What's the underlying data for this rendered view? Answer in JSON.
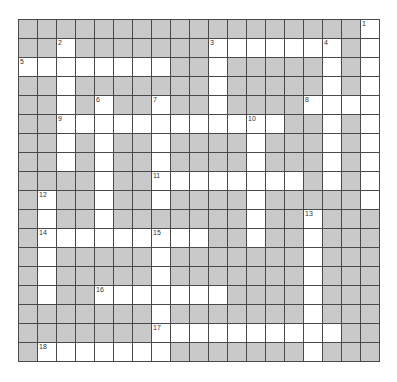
{
  "puzzle": {
    "rows": 18,
    "cols": 19,
    "colors": {
      "block": "#c9c9c9",
      "open": "#ffffff",
      "line": "#4a4a4a"
    },
    "layout": [
      "##################.",
      "##.#######.......#.",
      "........##.#####.#.",
      "##.#######.#####.#.",
      "##.#.##.##.####....",
      "##............##.#.",
      "##.#.##.####.###.#.",
      "##.#.##.####.###.#.",
      "####.##........#.#.",
      "#.##.##.####.#####.",
      "#.##.#######.##.###",
      "#.........##.##.###",
      "#.#####.#######.###",
      "#.#####.#######.###",
      "#.##.......####.###",
      "#######.#######.###",
      "#######..........##",
      "#.......#######.###"
    ],
    "numbers": [
      {
        "n": "1",
        "r": 0,
        "c": 18
      },
      {
        "n": "2",
        "r": 1,
        "c": 2
      },
      {
        "n": "3",
        "r": 1,
        "c": 10
      },
      {
        "n": "4",
        "r": 1,
        "c": 16
      },
      {
        "n": "5",
        "r": 2,
        "c": 0
      },
      {
        "n": "6",
        "r": 4,
        "c": 4
      },
      {
        "n": "7",
        "r": 4,
        "c": 7
      },
      {
        "n": "8",
        "r": 4,
        "c": 15
      },
      {
        "n": "9",
        "r": 5,
        "c": 2
      },
      {
        "n": "10",
        "r": 5,
        "c": 12
      },
      {
        "n": "11",
        "r": 8,
        "c": 7
      },
      {
        "n": "12",
        "r": 9,
        "c": 1
      },
      {
        "n": "13",
        "r": 10,
        "c": 15
      },
      {
        "n": "14",
        "r": 11,
        "c": 1
      },
      {
        "n": "15",
        "r": 11,
        "c": 7
      },
      {
        "n": "16",
        "r": 14,
        "c": 4
      },
      {
        "n": "17",
        "r": 16,
        "c": 7
      },
      {
        "n": "18",
        "r": 17,
        "c": 1
      }
    ]
  }
}
